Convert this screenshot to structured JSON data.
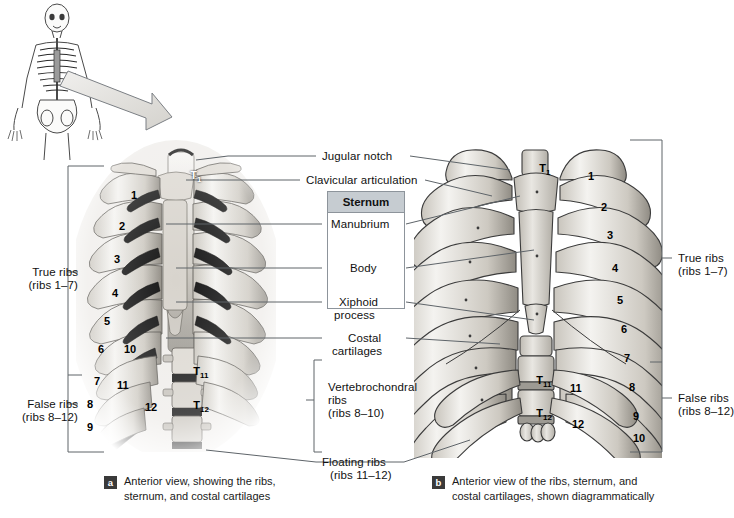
{
  "figure": {
    "background": "#ffffff",
    "ink": "#111111",
    "rule_color": "#6f767d",
    "bone_light": "#e8e6e1",
    "bone_mid": "#b9b6ae",
    "bone_dark": "#7d7a73",
    "photo_dark": "#1d1d1d"
  },
  "orientation_inset": {
    "name": "whole-skeleton-orientation-figure",
    "arrow": "pointer-from-thorax-to-panel-a"
  },
  "center_labels": {
    "jugular_notch": "Jugular notch",
    "clavicular_articulation": "Clavicular articulation",
    "sternum_header": "Sternum",
    "manubrium": "Manubrium",
    "body": "Body",
    "xiphoid_process_line1": "Xiphoid",
    "xiphoid_process_line2": "process",
    "costal_cartilages_line1": "Costal",
    "costal_cartilages_line2": "cartilages",
    "vertebrochondral_line1": "Vertebrochondral",
    "vertebrochondral_line2": "ribs",
    "vertebrochondral_line3": "(ribs 8–10)",
    "floating_ribs_line1": "Floating ribs",
    "floating_ribs_line2": "(ribs 11–12)"
  },
  "left_brackets": {
    "true_ribs_line1": "True ribs",
    "true_ribs_line2": "(ribs 1–7)",
    "false_ribs_line1": "False ribs",
    "false_ribs_line2": "(ribs 8–12)"
  },
  "right_brackets": {
    "true_ribs_line1": "True ribs",
    "true_ribs_line2": "(ribs 1–7)",
    "false_ribs_line1": "False ribs",
    "false_ribs_line2": "(ribs 8–12)"
  },
  "panel_a": {
    "badge": "a",
    "caption_line1": "Anterior view, showing the ribs,",
    "caption_line2": "sternum, and costal cartilages",
    "type": "photograph",
    "rib_numbers": [
      "1",
      "2",
      "3",
      "4",
      "5",
      "6",
      "7",
      "8",
      "9",
      "10",
      "11",
      "12"
    ],
    "vertebrae": [
      "T1",
      "T11",
      "T12"
    ],
    "vertebra_labels": [
      {
        "letter": "T",
        "sub": "1"
      },
      {
        "letter": "T",
        "sub": "11"
      },
      {
        "letter": "T",
        "sub": "12"
      }
    ]
  },
  "panel_b": {
    "badge": "b",
    "caption_line1": "Anterior view of the ribs, sternum, and",
    "caption_line2": "costal cartilages, shown diagrammatically",
    "type": "line-drawing",
    "rib_numbers": [
      "1",
      "2",
      "3",
      "4",
      "5",
      "6",
      "7",
      "8",
      "9",
      "10",
      "11",
      "12"
    ],
    "vertebrae": [
      "T1",
      "T11",
      "T12"
    ],
    "vertebra_labels": [
      {
        "letter": "T",
        "sub": "1"
      },
      {
        "letter": "T",
        "sub": "11"
      },
      {
        "letter": "T",
        "sub": "12"
      }
    ]
  }
}
